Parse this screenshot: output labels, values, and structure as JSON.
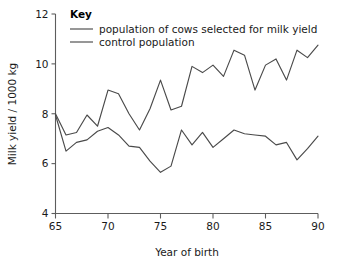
{
  "chart_data": {
    "type": "line",
    "title": "",
    "xlabel": "Year of birth",
    "ylabel": "Milk yield / 1000 kg",
    "xlim": [
      65,
      90
    ],
    "ylim": [
      4,
      12
    ],
    "xticks": [
      65,
      70,
      75,
      80,
      85,
      90
    ],
    "yticks": [
      4,
      6,
      8,
      10,
      12
    ],
    "grid": false,
    "legend_position": "top-left",
    "legend_title": "Key",
    "x": [
      65,
      66,
      67,
      68,
      69,
      70,
      71,
      72,
      73,
      74,
      75,
      76,
      77,
      78,
      79,
      80,
      81,
      82,
      83,
      84,
      85,
      86,
      87,
      88,
      89,
      90
    ],
    "series": [
      {
        "name": "population of cows selected for milk yield",
        "color": "#4a4a4a",
        "values": [
          8.0,
          7.15,
          7.25,
          7.95,
          7.5,
          8.95,
          8.8,
          8.0,
          7.35,
          8.2,
          9.35,
          8.15,
          8.3,
          9.9,
          9.65,
          9.95,
          9.5,
          10.55,
          10.35,
          8.95,
          9.95,
          10.2,
          9.35,
          10.55,
          10.25,
          10.75
        ]
      },
      {
        "name": "control population",
        "color": "#4a4a4a",
        "values": [
          7.95,
          6.5,
          6.85,
          6.95,
          7.3,
          7.45,
          7.15,
          6.7,
          6.65,
          6.1,
          5.65,
          5.9,
          7.35,
          6.75,
          7.25,
          6.65,
          7.0,
          7.35,
          7.2,
          7.15,
          7.1,
          6.75,
          6.85,
          6.15,
          6.6,
          7.1
        ]
      }
    ],
    "series_right_tail": {
      "control_tail": [
        7.1,
        6.75,
        6.55,
        6.4,
        6.5,
        5.65
      ],
      "note": ""
    }
  },
  "legend": {
    "title": "Key",
    "entries": [
      {
        "label": "population of cows selected for milk yield"
      },
      {
        "label": "control population"
      }
    ]
  },
  "axes": {
    "y_title": "Milk yield / 1000 kg",
    "x_title": "Year of birth",
    "y_tick_labels": [
      "4",
      "6",
      "8",
      "10",
      "12"
    ],
    "x_tick_labels": [
      "65",
      "70",
      "75",
      "80",
      "85",
      "90"
    ]
  },
  "colors": {
    "line": "#4a4a4a",
    "axis": "#5d5d5d",
    "text": "#1a1a1a",
    "background": "#ffffff"
  }
}
